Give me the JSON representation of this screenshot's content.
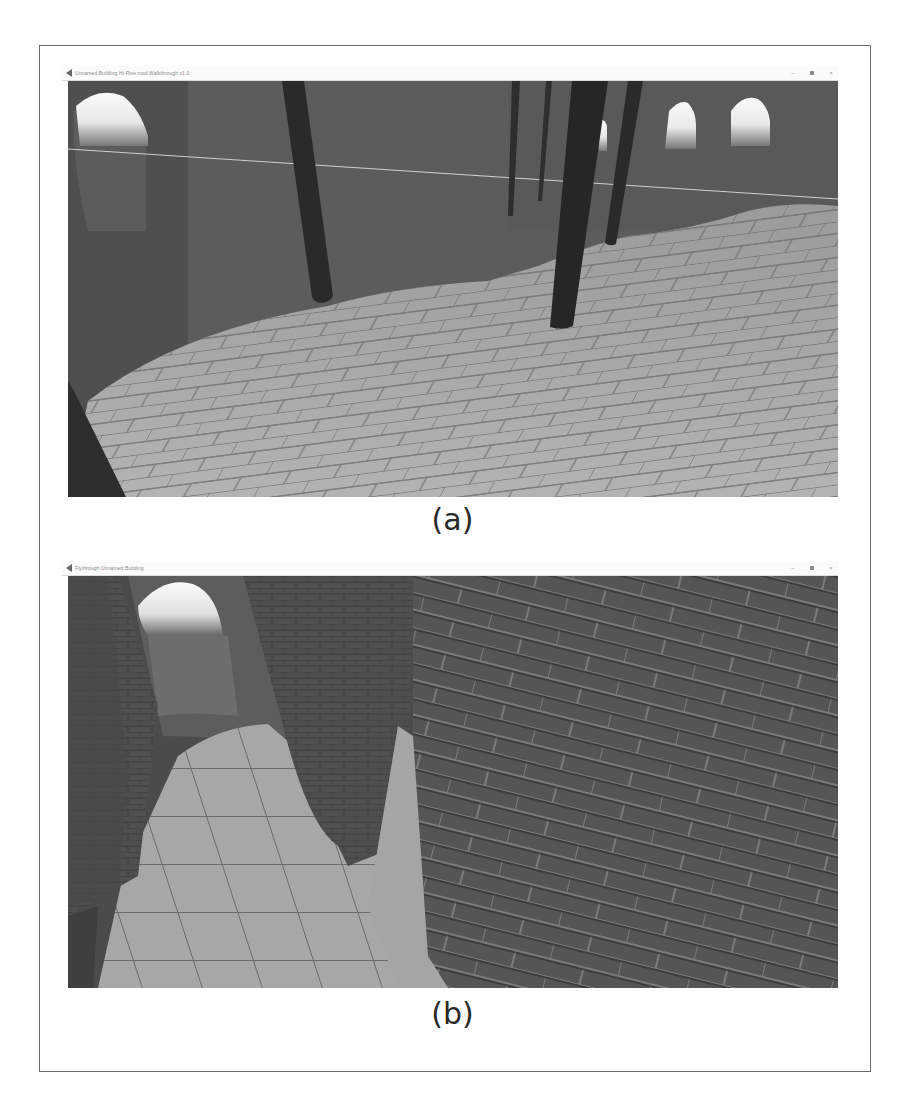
{
  "figure": {
    "panels": [
      {
        "id": "a",
        "caption": "(a)",
        "window": {
          "title": "Unnamed Building Hi-Rise mod Walkthrough v1.0",
          "controls": {
            "minimize": "–",
            "maximize": "□",
            "close": "×"
          }
        },
        "scene": "interior hall with dark cylindrical pillars, arched windows and paved stone floor"
      },
      {
        "id": "b",
        "caption": "(b)",
        "window": {
          "title": "Flythrough Unnamed Building",
          "controls": {
            "minimize": "–",
            "maximize": "□",
            "close": "×"
          }
        },
        "scene": "narrow corridor with brick walls, arched opening and paved floor"
      }
    ]
  },
  "colors": {
    "frame": "#6b6b6b",
    "wall": "#5a5a5a",
    "pillar": "#2b2b2b",
    "floor": "#a9a9a9",
    "window_light": "#f4f4f4"
  }
}
